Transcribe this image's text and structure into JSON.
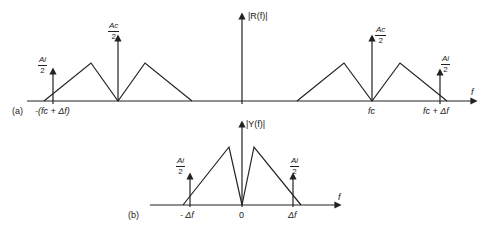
{
  "figure": {
    "panel_a": {
      "tag": "(a)",
      "y_label": "|R(f)|",
      "x_label": "f",
      "carrier_label": {
        "numerator": "Ac",
        "denominator": "2"
      },
      "interferer_label": {
        "numerator": "Ai",
        "denominator": "2"
      },
      "ticks": [
        "-(fc + Δf)",
        "fc",
        "fc + Δf"
      ]
    },
    "panel_b": {
      "tag": "(b)",
      "y_label": "|Y(f)|",
      "x_label": "f",
      "interferer_label": {
        "numerator": "Ai",
        "denominator": "2"
      },
      "ticks": [
        "- Δf",
        "0",
        "Δf"
      ]
    }
  }
}
